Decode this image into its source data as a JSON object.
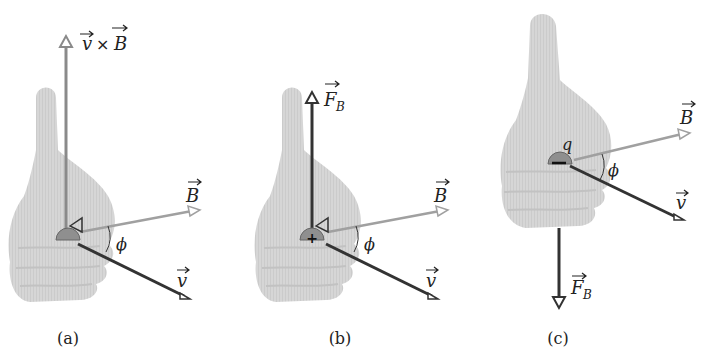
{
  "top_text_cut": {
    "left": "",
    "right": ""
  },
  "panels": [
    {
      "caption": "(a)",
      "up_vector_label": "v × B",
      "up_vector_label_parts": [
        "v",
        "×",
        "B"
      ],
      "b_label": "B",
      "v_label": "v",
      "angle_label": "ϕ",
      "charge_sign": ""
    },
    {
      "caption": "(b)",
      "up_vector_label": "F",
      "up_vector_sub": "B",
      "b_label": "B",
      "v_label": "v",
      "angle_label": "ϕ",
      "charge_sign": "+"
    },
    {
      "caption": "(c)",
      "charge_label": "q",
      "down_vector_label": "F",
      "down_vector_sub": "B",
      "b_label": "B",
      "v_label": "v",
      "angle_label": "ϕ",
      "charge_sign": "−"
    }
  ],
  "colors": {
    "hand": "#d4d4d4",
    "b_vector": "#9a9a9a",
    "v_vector": "#333333",
    "force_vector": "#333333",
    "cross_vector": "#8a8a8a"
  }
}
